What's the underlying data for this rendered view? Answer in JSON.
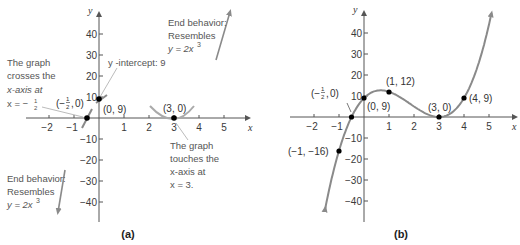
{
  "chart_data": [
    {
      "panel": "a",
      "type": "line",
      "caption": "(a)",
      "function": "y = 2x^3 - 11x^2 + 12x + 9",
      "xlabel": "x",
      "ylabel": "y",
      "xticks": [
        -2,
        -1,
        1,
        2,
        3,
        4,
        5
      ],
      "yticks": [
        40,
        30,
        20,
        10,
        -10,
        -20,
        -30,
        -40
      ],
      "xlim": [
        -3,
        6
      ],
      "ylim": [
        -50,
        50
      ],
      "grid": false,
      "points": [
        {
          "x": -0.5,
          "y": 0,
          "label": "(−½, 0)"
        },
        {
          "x": 0,
          "y": 9,
          "label": "(0, 9)"
        },
        {
          "x": 3,
          "y": 0,
          "label": "(3, 0)"
        }
      ],
      "annotations": {
        "crosses": [
          "The graph",
          "crosses the",
          "x-axis at",
          "x = −½."
        ],
        "intercept": "y -intercept: 9",
        "touches": [
          "The graph",
          "touches the",
          "x-axis at",
          "x = 3."
        ],
        "end_top": [
          "End behavior:",
          "Resembles",
          "y = 2x³"
        ],
        "end_bottom": [
          "End behavior:",
          "Resembles",
          "y = 2x³"
        ]
      }
    },
    {
      "panel": "b",
      "type": "line",
      "caption": "(b)",
      "function": "y = 2x^3 - 11x^2 + 12x + 9",
      "xlabel": "x",
      "ylabel": "y",
      "xticks": [
        -2,
        -1,
        1,
        2,
        3,
        4,
        5
      ],
      "yticks": [
        40,
        30,
        20,
        10,
        -10,
        -20,
        -30,
        -40
      ],
      "xlim": [
        -3,
        6
      ],
      "ylim": [
        -50,
        50
      ],
      "grid": false,
      "points": [
        {
          "x": -1,
          "y": -16,
          "label": "(−1, −16)"
        },
        {
          "x": -0.5,
          "y": 0,
          "label": "(−½, 0)"
        },
        {
          "x": 0,
          "y": 9,
          "label": "(0, 9)"
        },
        {
          "x": 1,
          "y": 12,
          "label": "(1, 12)"
        },
        {
          "x": 3,
          "y": 0,
          "label": "(3, 0)"
        },
        {
          "x": 4,
          "y": 9,
          "label": "(4, 9)"
        }
      ]
    }
  ],
  "labels": {
    "x": "x",
    "y": "y",
    "cap_a": "(a)",
    "cap_b": "(b)",
    "xt": [
      "−2",
      "−1",
      "1",
      "2",
      "3",
      "4",
      "5"
    ],
    "yt_pos": [
      "40",
      "30",
      "20",
      "10"
    ],
    "yt_neg": [
      "−10",
      "−20",
      "−30",
      "−40"
    ],
    "a_cross": [
      "The graph",
      "crosses the",
      "x-axis at",
      "x = −"
    ],
    "a_intercept": "y -intercept: 9",
    "a_touch": [
      "The graph",
      "touches the",
      "x-axis at",
      "x = 3."
    ],
    "end": [
      "End behavior:",
      "Resembles",
      "y = 2x"
    ],
    "p_half": "0)",
    "p_09": "(0, 9)",
    "p_30": "(3, 0)",
    "p_112": "(1, 12)",
    "p_49": "(4, 9)",
    "p_m1": "(−1, −16)"
  },
  "colors": {
    "curve": "#8a8a8a",
    "axis": "#555555",
    "point": "#000000"
  }
}
